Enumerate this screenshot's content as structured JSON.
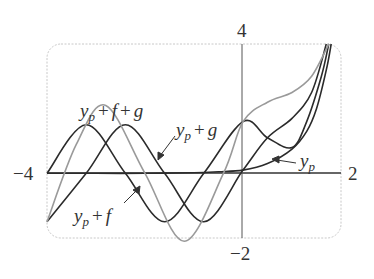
{
  "chart_data": {
    "type": "line",
    "title": "",
    "xlabel": "",
    "ylabel": "",
    "xlim": [
      -4,
      2
    ],
    "ylim": [
      -2,
      4
    ],
    "grid": false,
    "frame": "rounded dashed box",
    "tick_labels": {
      "x_left": "−4",
      "x_right": "2",
      "y_top": "4",
      "y_bottom": "−2"
    },
    "series": [
      {
        "name": "y_p",
        "color": "#2b2b2b",
        "description": "near zero for x<0, rises slowly then sharply near x≈1.8",
        "x": [
          -4,
          -3,
          -2,
          -1,
          -0.5,
          0,
          0.5,
          1.0,
          1.3,
          1.5,
          1.7,
          1.8
        ],
        "y": [
          0.0,
          0.0,
          0.0,
          0.02,
          0.05,
          0.1,
          0.3,
          0.75,
          1.3,
          2.0,
          3.2,
          4.0
        ]
      },
      {
        "name": "y_p + f",
        "color": "#2b2b2b",
        "x": [
          -4,
          -3.2,
          -2.4,
          -1.6,
          -0.8,
          0,
          0.5,
          1.0,
          1.4,
          1.7
        ],
        "y": [
          -1.5,
          0.0,
          1.5,
          0.0,
          -1.5,
          0.1,
          1.1,
          1.7,
          2.5,
          4.0
        ]
      },
      {
        "name": "y_p + g",
        "color": "#2b2b2b",
        "x": [
          -4,
          -3.2,
          -2.4,
          -1.6,
          -0.8,
          0,
          0.5,
          1.0,
          1.3,
          1.6,
          1.75
        ],
        "y": [
          0.0,
          1.5,
          0.0,
          -1.5,
          0.0,
          1.6,
          1.1,
          0.8,
          1.6,
          3.0,
          4.0
        ]
      },
      {
        "name": "y_p + f + g",
        "color": "#9a9a9a",
        "x": [
          -4,
          -3.4,
          -2.8,
          -2.0,
          -1.2,
          -0.4,
          0,
          0.5,
          1.0,
          1.4,
          1.75
        ],
        "y": [
          -1.5,
          0.9,
          2.1,
          0.0,
          -2.1,
          0.0,
          1.6,
          2.2,
          2.5,
          3.0,
          4.0
        ]
      }
    ],
    "annotations": [
      {
        "text": "y_p + f + g",
        "target": "gray curve peak near x=-2.8"
      },
      {
        "text": "y_p + g",
        "target": "arrow to dark curve near x=-1.9"
      },
      {
        "text": "y_p + f",
        "target": "arrow to dark curve near x=-2.0"
      },
      {
        "text": "y_p",
        "target": "arrow to y_p near x=0.6"
      }
    ]
  },
  "labels": {
    "ypfg": {
      "y": "y",
      "sub": "p",
      "rest1": "+",
      "v1": "f",
      "rest2": "+",
      "v2": "g"
    },
    "ypg": {
      "y": "y",
      "sub": "p",
      "rest1": "+",
      "v1": "g"
    },
    "ypf": {
      "y": "y",
      "sub": "p",
      "rest1": "+",
      "v1": "f"
    },
    "yp": {
      "y": "y",
      "sub": "p"
    }
  }
}
